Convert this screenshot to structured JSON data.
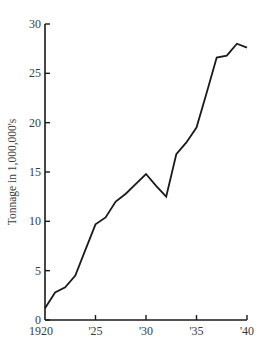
{
  "chart_data": {
    "type": "line",
    "title": "",
    "xlabel": "",
    "ylabel": "Tonnage in 1,000,000's",
    "x": [
      1920,
      1921,
      1922,
      1923,
      1924,
      1925,
      1926,
      1927,
      1928,
      1929,
      1930,
      1931,
      1932,
      1933,
      1934,
      1935,
      1936,
      1937,
      1938,
      1939,
      1940
    ],
    "series": [
      {
        "name": "Tonnage",
        "values": [
          1.2,
          2.8,
          3.3,
          4.5,
          7.1,
          9.7,
          10.4,
          12.0,
          12.8,
          13.8,
          14.8,
          13.6,
          12.5,
          16.8,
          18.0,
          19.5,
          23.0,
          26.6,
          26.8,
          28.0,
          27.6
        ]
      }
    ],
    "xlim": [
      1920,
      1940
    ],
    "ylim": [
      0,
      30
    ],
    "xticks": [
      1920,
      1925,
      1930,
      1935,
      1940
    ],
    "xtick_labels": [
      "1920",
      "'25",
      "'30",
      "'35",
      "'40"
    ],
    "yticks": [
      0,
      5,
      10,
      15,
      20,
      25,
      30
    ],
    "ytick_labels": [
      "0",
      "5",
      "10",
      "15",
      "20",
      "25",
      "30"
    ],
    "grid": false,
    "legend": null,
    "line_color": "#1a1a1a"
  }
}
